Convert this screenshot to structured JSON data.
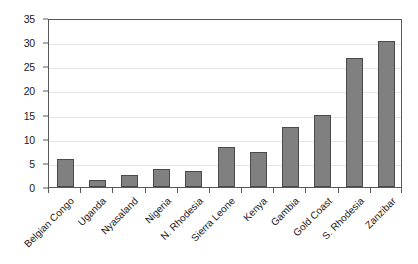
{
  "chart_data": {
    "type": "bar",
    "title": "",
    "subtitle": "",
    "xlabel": "",
    "ylabel": "",
    "ylim": [
      0,
      35
    ],
    "y_ticks": [
      0,
      5,
      10,
      15,
      20,
      25,
      30,
      35
    ],
    "grid": true,
    "legend": false,
    "legend_position": "none",
    "categories": [
      "Belgian Congo",
      "Uganda",
      "Nyasaland",
      "Nigeria",
      "N. Rhodesia",
      "Sierra Leone",
      "Kenya",
      "Gambia",
      "Gold Coast",
      "S. Rhodesia",
      "Zanzibar"
    ],
    "values": [
      5.9,
      1.5,
      2.4,
      3.8,
      3.4,
      8.3,
      7.3,
      12.4,
      14.9,
      26.8,
      30.2
    ],
    "bar_color": "#808080",
    "bar_border_color": "#4a4a4a",
    "axis_color": "#585858",
    "gridline_color": "#e6e6ea",
    "background_color": "#ffffff"
  }
}
